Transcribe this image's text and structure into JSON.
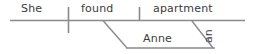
{
  "diagram": {
    "type": "sentence-diagram",
    "style": "reed-kellogg",
    "sentence": "She found Anne an apartment.",
    "colors": {
      "line": "#8a8a8a",
      "text": "#3b3b3b",
      "background": "#ffffff"
    },
    "baseline": {
      "x1": 10,
      "y1": 20,
      "x2": 245,
      "y2": 20
    },
    "dividers": [
      {
        "name": "subject-predicate-divider",
        "x": 68,
        "y1": 7,
        "y2": 33
      },
      {
        "name": "verb-object-divider",
        "x": 139,
        "y1": 7,
        "y2": 20
      }
    ],
    "words": [
      {
        "id": "subject",
        "label": "She",
        "role": "subject",
        "x": 21,
        "y": 3
      },
      {
        "id": "verb",
        "label": "found",
        "role": "verb",
        "x": 81,
        "y": 3
      },
      {
        "id": "direct-object",
        "label": "apartment",
        "role": "direct object",
        "x": 153,
        "y": 3
      },
      {
        "id": "indirect-object",
        "label": "Anne",
        "role": "indirect object",
        "x": 143,
        "y": 33
      },
      {
        "id": "article",
        "label": "an",
        "role": "article modifier",
        "x": 202,
        "y": 42,
        "rotated": true
      }
    ],
    "connectors": [
      {
        "name": "indirect-object-slant",
        "from_x": 103,
        "from_y": 20,
        "to_x": 127,
        "to_y": 48
      },
      {
        "name": "indirect-object-baseline",
        "from_x": 127,
        "from_y": 48,
        "to_x": 215,
        "to_y": 48
      },
      {
        "name": "article-modifier-slant",
        "from_x": 192,
        "from_y": 21,
        "to_x": 213,
        "to_y": 48
      }
    ]
  }
}
